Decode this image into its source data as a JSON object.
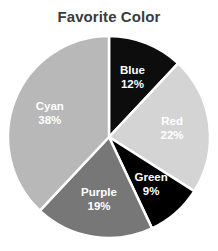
{
  "chart_data": {
    "type": "pie",
    "title": "Favorite Color",
    "xlabel": "",
    "ylabel": "",
    "categories": [
      "Blue",
      "Red",
      "Green",
      "Purple",
      "Cyan"
    ],
    "values": [
      12,
      22,
      9,
      19,
      38
    ],
    "value_labels": [
      "12%",
      "22%",
      "9%",
      "19%",
      "38%"
    ],
    "unit": "%",
    "start_angle_deg": 0,
    "direction": "clockwise",
    "legend": "none",
    "grid": false,
    "background_color": "#ffffff",
    "title_color": "#3b3b3b",
    "label_color": "#ffffff",
    "separator_color": "#ffffff",
    "slice_colors": [
      "#0d0d0d",
      "#d4d4d4",
      "#000000",
      "#777777",
      "#b8b8b8"
    ],
    "slices": [
      {
        "label": "Blue",
        "value": 12,
        "value_label": "12%",
        "color": "#0d0d0d"
      },
      {
        "label": "Red",
        "value": 22,
        "value_label": "22%",
        "color": "#d4d4d4"
      },
      {
        "label": "Green",
        "value": 9,
        "value_label": "9%",
        "color": "#000000"
      },
      {
        "label": "Purple",
        "value": 19,
        "value_label": "19%",
        "color": "#777777"
      },
      {
        "label": "Cyan",
        "value": 38,
        "value_label": "38%",
        "color": "#b8b8b8"
      }
    ]
  }
}
